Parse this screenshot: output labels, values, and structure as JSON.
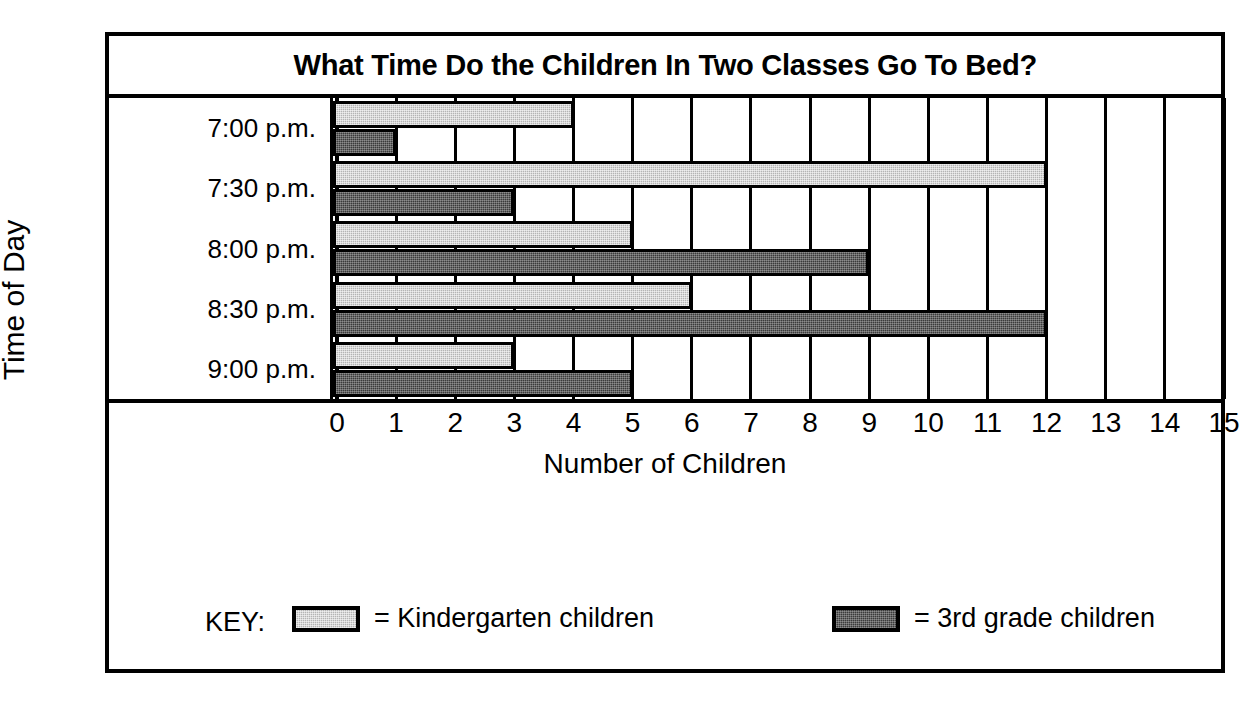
{
  "chart_data": {
    "type": "bar",
    "orientation": "horizontal",
    "title": "What Time Do the Children In Two Classes Go To Bed?",
    "xlabel": "Number of Children",
    "ylabel": "Time of Day",
    "categories": [
      "7:00 p.m.",
      "7:30 p.m.",
      "8:00 p.m.",
      "8:30 p.m.",
      "9:00 p.m."
    ],
    "series": [
      {
        "name": "Kindergarten children",
        "key": "kg",
        "color": "#b4b4b4",
        "values": [
          4,
          12,
          5,
          6,
          3
        ]
      },
      {
        "name": "3rd grade children",
        "key": "g3",
        "color": "#3b3b3b",
        "values": [
          1,
          3,
          9,
          12,
          5
        ]
      }
    ],
    "xticks": [
      0,
      1,
      2,
      3,
      4,
      5,
      6,
      7,
      8,
      9,
      10,
      11,
      12,
      13,
      14,
      15
    ],
    "xlim": [
      0,
      15
    ],
    "grid": true,
    "legend_position": "bottom"
  },
  "legend": {
    "key_label": "KEY:",
    "items": [
      {
        "equals": "= Kindergarten children"
      },
      {
        "equals": "= 3rd grade children"
      }
    ]
  }
}
